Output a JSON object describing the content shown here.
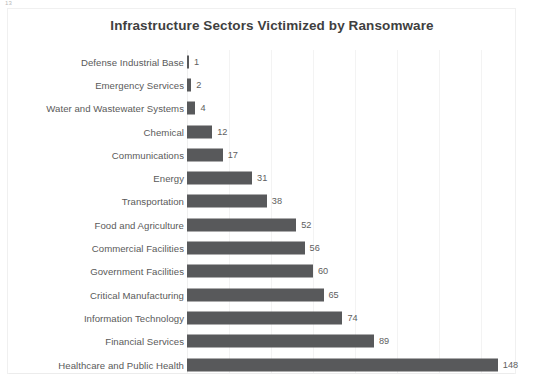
{
  "artifact": {
    "page_number": "13"
  },
  "chart_data": {
    "type": "bar",
    "orientation": "horizontal",
    "title": "Infrastructure Sectors Victimized by Ransomware",
    "xlabel": "",
    "ylabel": "",
    "categories": [
      "Defense Industrial Base",
      "Emergency Services",
      "Water and Wastewater Systems",
      "Chemical",
      "Communications",
      "Energy",
      "Transportation",
      "Food and Agriculture",
      "Commercial Facilities",
      "Government Facilities",
      "Critical Manufacturing",
      "Information Technology",
      "Financial Services",
      "Healthcare and Public Health"
    ],
    "values": [
      1,
      2,
      4,
      12,
      17,
      31,
      38,
      52,
      56,
      60,
      65,
      74,
      89,
      148
    ],
    "value_labels": [
      "1",
      "2",
      "4",
      "12",
      "17",
      "31",
      "38",
      "52",
      "56",
      "60",
      "65",
      "74",
      "89",
      "148"
    ],
    "xlim": [
      0,
      150
    ],
    "grid": true,
    "gridline_values": [
      20,
      40,
      60,
      80,
      100,
      120,
      140
    ],
    "legend": false,
    "data_labels": true,
    "colors": {
      "bar": "#58595B",
      "title": "#3F3F3F",
      "category_label": "#5A5A5A",
      "value_label": "#5E5E5E",
      "gridline": "#F3F3F3",
      "background": "#FFFFFF"
    }
  }
}
